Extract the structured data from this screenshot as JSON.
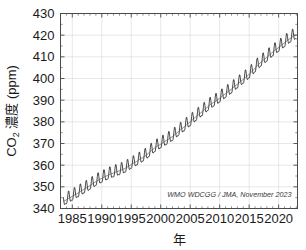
{
  "chart_data": {
    "type": "line",
    "title": "",
    "xlabel": "年",
    "ylabel": "CO2 濃度 (ppm)",
    "ylabel_main": "CO",
    "ylabel_sub": "2",
    "ylabel_rest": " 濃度 (ppm)",
    "xlim": [
      1983,
      2023.2
    ],
    "ylim": [
      340,
      430
    ],
    "grid": true,
    "legend": "none",
    "annotation": "WMO WDCGG / JMA, November 2023",
    "xticks": [
      1985,
      1990,
      1995,
      2000,
      2005,
      2010,
      2015,
      2020
    ],
    "xtick_labels": [
      "1985",
      "1990",
      "1995",
      "2000",
      "2005",
      "2010",
      "2015",
      "2020"
    ],
    "xminor_interval": 1,
    "yticks": [
      340,
      350,
      360,
      370,
      380,
      390,
      400,
      410,
      420,
      430
    ],
    "ytick_labels": [
      "340",
      "350",
      "360",
      "370",
      "380",
      "390",
      "400",
      "410",
      "420",
      "430"
    ],
    "series": [
      {
        "name": "Global mean CO2 monthly mean",
        "seasonal_amplitude_ppm": 2.6,
        "x": [
          1983.5,
          1984.0,
          1984.5,
          1985.0,
          1985.5,
          1986.0,
          1986.5,
          1987.0,
          1987.5,
          1988.0,
          1988.5,
          1989.0,
          1989.5,
          1990.0,
          1990.5,
          1991.0,
          1991.5,
          1992.0,
          1992.5,
          1993.0,
          1993.5,
          1994.0,
          1994.5,
          1995.0,
          1995.5,
          1996.0,
          1996.5,
          1997.0,
          1997.5,
          1998.0,
          1998.5,
          1999.0,
          1999.5,
          2000.0,
          2000.5,
          2001.0,
          2001.5,
          2002.0,
          2002.5,
          2003.0,
          2003.5,
          2004.0,
          2004.5,
          2005.0,
          2005.5,
          2006.0,
          2006.5,
          2007.0,
          2007.5,
          2008.0,
          2008.5,
          2009.0,
          2009.5,
          2010.0,
          2010.5,
          2011.0,
          2011.5,
          2012.0,
          2012.5,
          2013.0,
          2013.5,
          2014.0,
          2014.5,
          2015.0,
          2015.5,
          2016.0,
          2016.5,
          2017.0,
          2017.5,
          2018.0,
          2018.5,
          2019.0,
          2019.5,
          2020.0,
          2020.5,
          2021.0,
          2021.5,
          2022.0,
          2022.5,
          2023.0
        ],
        "trend_values": [
          343.3,
          344.0,
          344.8,
          345.6,
          346.4,
          347.2,
          348.1,
          348.9,
          349.7,
          350.6,
          351.5,
          352.4,
          353.2,
          353.9,
          354.6,
          355.3,
          355.9,
          356.4,
          356.9,
          357.4,
          357.9,
          358.6,
          359.4,
          360.3,
          361.1,
          361.9,
          362.8,
          363.6,
          364.5,
          365.7,
          366.9,
          368.0,
          368.9,
          369.7,
          370.6,
          371.4,
          372.3,
          373.2,
          374.3,
          375.5,
          376.6,
          377.7,
          378.9,
          380.0,
          381.2,
          382.4,
          383.5,
          384.6,
          385.8,
          387.0,
          388.1,
          389.0,
          389.9,
          390.9,
          392.0,
          393.0,
          394.0,
          395.1,
          396.3,
          397.4,
          398.5,
          399.6,
          400.8,
          402.0,
          403.3,
          404.8,
          406.3,
          407.5,
          408.6,
          409.8,
          411.0,
          412.2,
          413.3,
          414.3,
          415.4,
          416.5,
          417.6,
          418.6,
          419.5,
          420.2
        ]
      }
    ]
  },
  "figure": {
    "background_color": "#ffffff",
    "line_color": "#2b2b2b",
    "grid_color": "#d9d9d9",
    "frame_color": "#4a4a4a",
    "text_color": "#1a1a1a"
  }
}
